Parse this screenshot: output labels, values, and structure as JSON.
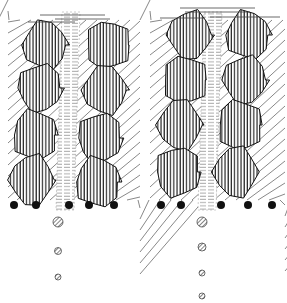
{
  "diagram": {
    "colors": {
      "ink": "#111111",
      "background": "#ffffff",
      "channel": "#888888"
    },
    "panels": [
      {
        "id": "left",
        "channel_x": 70,
        "grains_left": [
          [
            45,
            45,
            22,
            24
          ],
          [
            40,
            88,
            22,
            24
          ],
          [
            35,
            135,
            22,
            25
          ],
          [
            32,
            180,
            22,
            25
          ]
        ],
        "grains_right": [
          [
            108,
            45,
            22,
            24
          ],
          [
            105,
            90,
            22,
            24
          ],
          [
            100,
            138,
            22,
            25
          ],
          [
            98,
            182,
            22,
            25
          ]
        ],
        "bottom_dots": [
          14,
          36,
          69,
          89,
          114
        ],
        "falling_particles": [
          [
            58,
            222,
            5
          ],
          [
            58,
            251,
            3.5
          ],
          [
            58,
            277,
            3
          ]
        ]
      },
      {
        "id": "right",
        "channel_x": 212,
        "grains_left": [
          [
            190,
            35,
            22,
            24
          ],
          [
            185,
            80,
            22,
            24
          ],
          [
            180,
            125,
            22,
            25
          ],
          [
            178,
            172,
            22,
            25
          ]
        ],
        "grains_right": [
          [
            248,
            35,
            22,
            24
          ],
          [
            245,
            80,
            22,
            24
          ],
          [
            240,
            125,
            22,
            25
          ],
          [
            236,
            172,
            22,
            25
          ]
        ],
        "bottom_dots": [
          161,
          181,
          221,
          248,
          272
        ],
        "falling_particles": [
          [
            202,
            222,
            5
          ],
          [
            202,
            247,
            4
          ],
          [
            202,
            273,
            3
          ],
          [
            202,
            296,
            3
          ]
        ]
      }
    ]
  }
}
